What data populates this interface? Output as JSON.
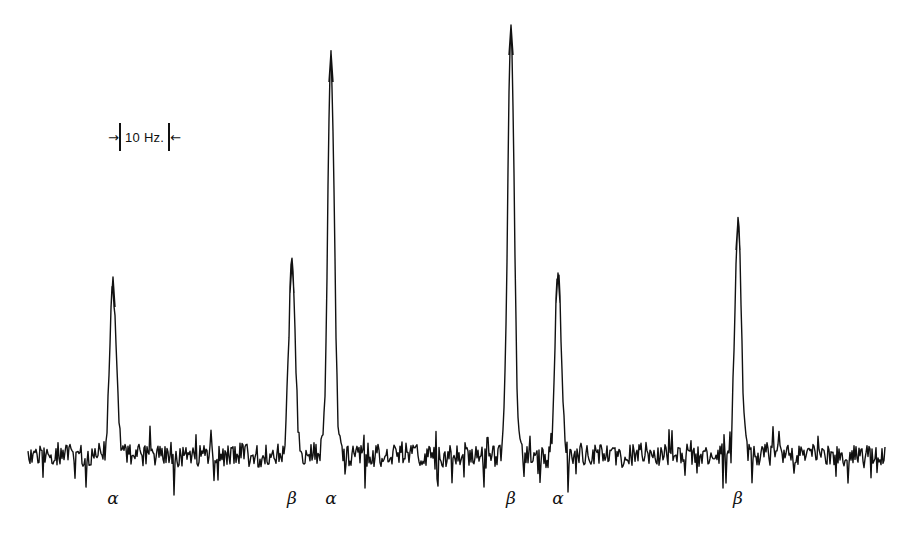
{
  "scale_bar": {
    "label": "10 Hz.",
    "left_arrow": "→",
    "right_arrow": "←"
  },
  "colors": {
    "trace": "#111111",
    "background": "#ffffff"
  },
  "chart_data": {
    "type": "line",
    "title": "",
    "xlabel": "",
    "ylabel": "",
    "scale_annotation": "10 Hz.",
    "grid": false,
    "baseline_y_px": 455,
    "peaks": [
      {
        "label": "α",
        "x_px": 113,
        "top_y_px": 277,
        "relative_height": 0.41
      },
      {
        "label": "β",
        "x_px": 292,
        "top_y_px": 263,
        "relative_height": 0.44
      },
      {
        "label": "α",
        "x_px": 331,
        "top_y_px": 52,
        "relative_height": 0.94
      },
      {
        "label": "β",
        "x_px": 511,
        "top_y_px": 25,
        "relative_height": 1.0
      },
      {
        "label": "α",
        "x_px": 558,
        "top_y_px": 273,
        "relative_height": 0.42
      },
      {
        "label": "β",
        "x_px": 738,
        "top_y_px": 220,
        "relative_height": 0.55
      }
    ],
    "x_range_px": [
      28,
      885
    ],
    "labels_y_px": 500
  }
}
